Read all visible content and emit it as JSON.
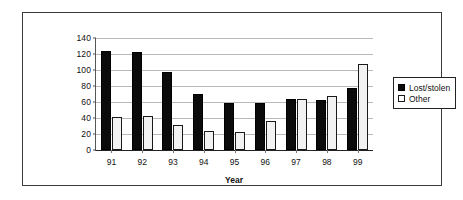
{
  "chart_data": {
    "type": "bar",
    "title": "",
    "xlabel": "Year",
    "ylabel": "",
    "categories": [
      "91",
      "92",
      "93",
      "94",
      "95",
      "96",
      "97",
      "98",
      "99"
    ],
    "series": [
      {
        "name": "Lost/stolen",
        "color": "#0b0b0b",
        "values": [
          124,
          123,
          98,
          70,
          59,
          59,
          64,
          63,
          78
        ]
      },
      {
        "name": "Other",
        "color": "#ffffff",
        "values": [
          41,
          42,
          31,
          24,
          22,
          36,
          64,
          68,
          107
        ]
      }
    ],
    "ylim": [
      0,
      140
    ],
    "ytick_labels": [
      "0",
      "20",
      "40",
      "60",
      "80",
      "100",
      "120",
      "140"
    ],
    "ytick_values": [
      0,
      20,
      40,
      60,
      80,
      100,
      120,
      140
    ],
    "grid": true,
    "legend_position": "right"
  },
  "legend": {
    "items": [
      {
        "label": "Lost/stolen",
        "swatch": "filled-black-square-icon"
      },
      {
        "label": "Other",
        "swatch": "outlined-white-square-icon"
      }
    ]
  },
  "axis": {
    "x_title": "Year"
  }
}
